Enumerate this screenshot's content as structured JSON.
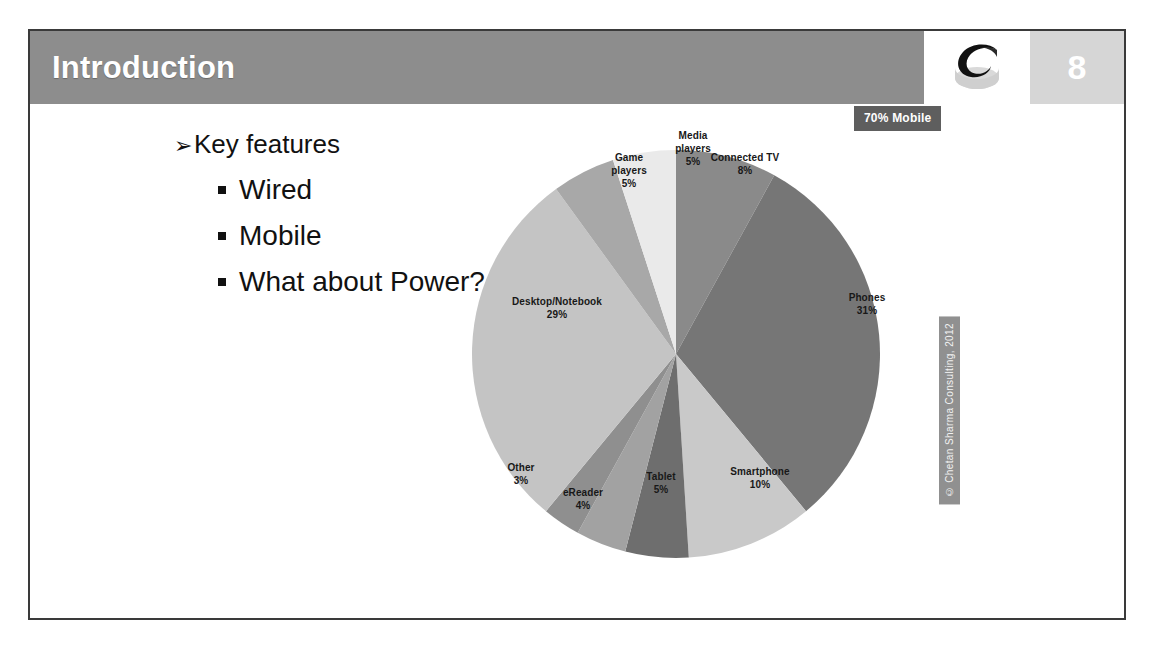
{
  "header": {
    "title": "Introduction",
    "page_number": "8",
    "logo_name": "chetan-sharma-ribbon-logo",
    "bar_color": "#8d8d8d",
    "page_block_color": "#d6d6d6"
  },
  "content": {
    "bullets": [
      {
        "level": 1,
        "marker": "➢",
        "text": "Key features"
      },
      {
        "level": 2,
        "marker": "▪",
        "text": "Wired"
      },
      {
        "level": 2,
        "marker": "▪",
        "text": "Mobile"
      },
      {
        "level": 2,
        "marker": "▪",
        "text": "What about Power?"
      }
    ]
  },
  "callout": {
    "text": "70% Mobile",
    "bg_color": "#5e5e5e",
    "text_color": "#ffffff"
  },
  "copyright": {
    "text": "© Chetan Sharma Consulting, 2012",
    "bg_color": "#909090"
  },
  "chart_data": {
    "type": "pie",
    "title": "",
    "legend_position": "inside-labels",
    "start_angle_deg": 0,
    "direction": "clockwise",
    "categories": [
      "Connected TV",
      "Phones",
      "Smartphone",
      "Tablet",
      "eReader",
      "Other",
      "Desktop/Notebook",
      "Game players",
      "Media players"
    ],
    "values": [
      8,
      31,
      10,
      5,
      4,
      3,
      29,
      5,
      5
    ],
    "value_unit": "%",
    "colors": [
      "#8a8a8a",
      "#767676",
      "#c9c9c9",
      "#6e6e6e",
      "#a2a2a2",
      "#8f8f8f",
      "#c4c4c4",
      "#a8a8a8",
      "#eaeaea"
    ],
    "labels": [
      {
        "name": "Connected TV",
        "value": "8%",
        "display": "Connected TV\n8%"
      },
      {
        "name": "Phones",
        "value": "31%",
        "display": "Phones\n31%"
      },
      {
        "name": "Smartphone",
        "value": "10%",
        "display": "Smartphone\n10%"
      },
      {
        "name": "Tablet",
        "value": "5%",
        "display": "Tablet\n5%"
      },
      {
        "name": "eReader",
        "value": "4%",
        "display": "eReader\n4%"
      },
      {
        "name": "Other",
        "value": "3%",
        "display": "Other\n3%"
      },
      {
        "name": "Desktop/Notebook",
        "value": "29%",
        "display": "Desktop/Notebook\n29%"
      },
      {
        "name": "Game players",
        "value": "5%",
        "display": "Game\nplayers\n5%"
      },
      {
        "name": "Media players",
        "value": "5%",
        "display": "Media\nplayers\n5%"
      }
    ]
  }
}
